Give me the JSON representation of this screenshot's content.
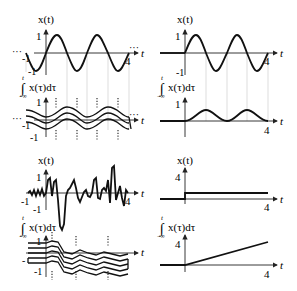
{
  "panels": {
    "top_left": {
      "x_label": "x(t)",
      "int_label": "x(τ)dτ",
      "int_upper": "t",
      "int_lower": "−∞",
      "y_top": "1",
      "y_bottom": "-1",
      "x_end": "4",
      "x_start": "-1",
      "t_label": "t",
      "int_y_top": "1",
      "int_y_bottom": "-1",
      "int_x_start": "-1",
      "ellipsis": "···"
    },
    "top_right": {
      "x_label": "x(t)",
      "int_label": "x(τ)dτ",
      "int_upper": "t",
      "int_lower": "−∞",
      "y_top": "1",
      "y_bottom": "-1",
      "x_end": "4",
      "t_label": "t",
      "int_y_top": "1",
      "int_x_end": "4"
    },
    "bottom_left": {
      "x_label": "x(t)",
      "int_label": "x(τ)dτ",
      "int_upper": "t",
      "int_lower": "−∞",
      "y_top": "1",
      "y_bottom": "-1",
      "x_start": "-1",
      "x_end": "4",
      "t_label": "t",
      "int_y_top": "1",
      "int_y_bottom": "-1",
      "int_x_start": "-"
    },
    "bottom_right": {
      "x_label": "x(t)",
      "int_label": "x(τ)dτ",
      "int_upper": "t",
      "int_lower": "−∞",
      "y_top": "4",
      "x_end": "4",
      "t_label": "t",
      "int_y_top": "4",
      "int_x_end": "4"
    }
  }
}
